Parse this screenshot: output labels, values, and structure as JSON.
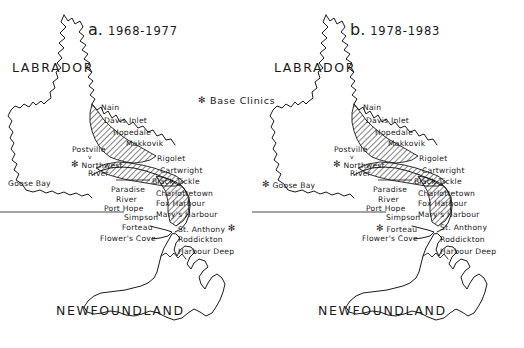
{
  "figure": {
    "background_color": "#ffffff",
    "ink_color": "#1a1a1a",
    "legend": {
      "symbol": "asterisk-symbol",
      "symbol_glyph": "✻",
      "label": "Base Clinics"
    }
  },
  "panels": [
    {
      "id": "panel-a",
      "letter": "a.",
      "years": "1968-1977",
      "regions": [
        {
          "name": "LABRADOR"
        },
        {
          "name": "NEWFOUNDLAND"
        }
      ],
      "places": [
        {
          "name": "Nain",
          "base_clinic": false,
          "star_side": "none"
        },
        {
          "name": "Davis Inlet",
          "base_clinic": false,
          "star_side": "none"
        },
        {
          "name": "Hopedale",
          "base_clinic": false,
          "star_side": "none"
        },
        {
          "name": "Makkovik",
          "base_clinic": false,
          "star_side": "none"
        },
        {
          "name": "Postville",
          "base_clinic": false,
          "star_side": "none"
        },
        {
          "name": "Northwest",
          "base_clinic": true,
          "star_side": "left"
        },
        {
          "name": "River",
          "base_clinic": false,
          "star_side": "none"
        },
        {
          "name": "Goose Bay",
          "base_clinic": false,
          "star_side": "none"
        },
        {
          "name": "Rigolet",
          "base_clinic": false,
          "star_side": "none"
        },
        {
          "name": "Cartwright",
          "base_clinic": false,
          "star_side": "none"
        },
        {
          "name": "Black Tickle",
          "base_clinic": false,
          "star_side": "none"
        },
        {
          "name": "Paradise",
          "base_clinic": false,
          "star_side": "none"
        },
        {
          "name": "River",
          "base_clinic": false,
          "star_side": "none"
        },
        {
          "name": "Port Hope",
          "base_clinic": false,
          "star_side": "none"
        },
        {
          "name": "Simpson",
          "base_clinic": false,
          "star_side": "none"
        },
        {
          "name": "Charlottetown",
          "base_clinic": false,
          "star_side": "none"
        },
        {
          "name": "Fox Harbour",
          "base_clinic": false,
          "star_side": "none"
        },
        {
          "name": "Mary's Harbour",
          "base_clinic": false,
          "star_side": "none"
        },
        {
          "name": "Forteau",
          "base_clinic": false,
          "star_side": "none"
        },
        {
          "name": "St. Anthony",
          "base_clinic": true,
          "star_side": "right"
        },
        {
          "name": "Flower's Cove",
          "base_clinic": false,
          "star_side": "none"
        },
        {
          "name": "Roddickton",
          "base_clinic": false,
          "star_side": "none"
        },
        {
          "name": "Harbour Deep",
          "base_clinic": false,
          "star_side": "none"
        }
      ]
    },
    {
      "id": "panel-b",
      "letter": "b.",
      "years": "1978-1983",
      "regions": [
        {
          "name": "LABRADOR"
        },
        {
          "name": "NEWFOUNDLAND"
        }
      ],
      "places": [
        {
          "name": "Nain",
          "base_clinic": false,
          "star_side": "none"
        },
        {
          "name": "Davis Inlet",
          "base_clinic": false,
          "star_side": "none"
        },
        {
          "name": "Hopedale",
          "base_clinic": false,
          "star_side": "none"
        },
        {
          "name": "Makkovik",
          "base_clinic": false,
          "star_side": "none"
        },
        {
          "name": "Postville",
          "base_clinic": false,
          "star_side": "none"
        },
        {
          "name": "Northwest",
          "base_clinic": true,
          "star_side": "left"
        },
        {
          "name": "River",
          "base_clinic": false,
          "star_side": "none"
        },
        {
          "name": "Goose Bay",
          "base_clinic": true,
          "star_side": "left"
        },
        {
          "name": "Rigolet",
          "base_clinic": false,
          "star_side": "none"
        },
        {
          "name": "Cartwright",
          "base_clinic": false,
          "star_side": "none"
        },
        {
          "name": "Black Tickle",
          "base_clinic": false,
          "star_side": "none"
        },
        {
          "name": "Paradise",
          "base_clinic": false,
          "star_side": "none"
        },
        {
          "name": "River",
          "base_clinic": false,
          "star_side": "none"
        },
        {
          "name": "Port Hope",
          "base_clinic": false,
          "star_side": "none"
        },
        {
          "name": "Simpson",
          "base_clinic": false,
          "star_side": "none"
        },
        {
          "name": "Charlottetown",
          "base_clinic": false,
          "star_side": "none"
        },
        {
          "name": "Fox Harbour",
          "base_clinic": false,
          "star_side": "none"
        },
        {
          "name": "Mary's Harbour",
          "base_clinic": false,
          "star_side": "none"
        },
        {
          "name": "Forteau",
          "base_clinic": true,
          "star_side": "left"
        },
        {
          "name": "St. Anthony",
          "base_clinic": false,
          "star_side": "none"
        },
        {
          "name": "Flower's Cove",
          "base_clinic": false,
          "star_side": "none"
        },
        {
          "name": "Roddickton",
          "base_clinic": false,
          "star_side": "none"
        },
        {
          "name": "Harbour Deep",
          "base_clinic": false,
          "star_side": "none"
        }
      ]
    }
  ],
  "text": {
    "a_letter": "a.",
    "a_years": "1968-1977",
    "b_letter": "b.",
    "b_years": "1978-1983",
    "labrador": "LABRADOR",
    "newfoundland": "NEWFOUNDLAND",
    "base_clinics": "Base Clinics",
    "star": "✻",
    "nain": "Nain",
    "davis_inlet": "Davis Inlet",
    "hopedale": "Hopedale",
    "makkovik": "Makkovik",
    "postville": "Postville",
    "northwest": "Northwest",
    "river": "River",
    "goose_bay": "Goose Bay",
    "rigolet": "Rigolet",
    "cartwright": "Cartwright",
    "black_tickle": "Black Tickle",
    "paradise": "Paradise",
    "paradise_river": "River",
    "port_hope": "Port Hope",
    "simpson": "Simpson",
    "charlottetown": "Charlottetown",
    "fox_harbour": "Fox Harbour",
    "marys_harbour": "Mary's Harbour",
    "forteau": "Forteau",
    "st_anthony": "St. Anthony",
    "flowers_cove": "Flower's Cove",
    "roddickton": "Roddickton",
    "harbour_deep": "Harbour Deep",
    "tick": "v"
  }
}
